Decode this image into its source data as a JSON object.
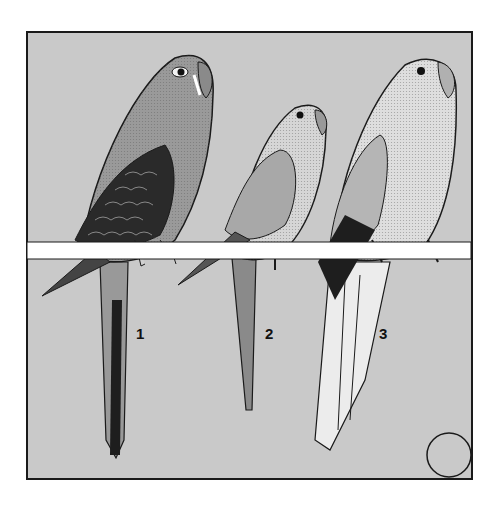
{
  "illustration": {
    "subject": "Three parrots perched on a horizontal bar",
    "background_color": "#c9c9c9",
    "perch_color": "#ffffff",
    "outline_color": "#1a1a1a",
    "birds": [
      {
        "label": "1",
        "body_color": "#9a9a9a",
        "wing_color": "#2a2a2a",
        "tail_color": "#222222"
      },
      {
        "label": "2",
        "body_color": "#d6d6d6",
        "wing_color": "#a8a8a8",
        "tail_color": "#8a8a8a"
      },
      {
        "label": "3",
        "body_color": "#dedede",
        "wing_color": "#b5b5b5",
        "tail_color": "#ececec"
      }
    ],
    "marker": "empty-circle"
  }
}
